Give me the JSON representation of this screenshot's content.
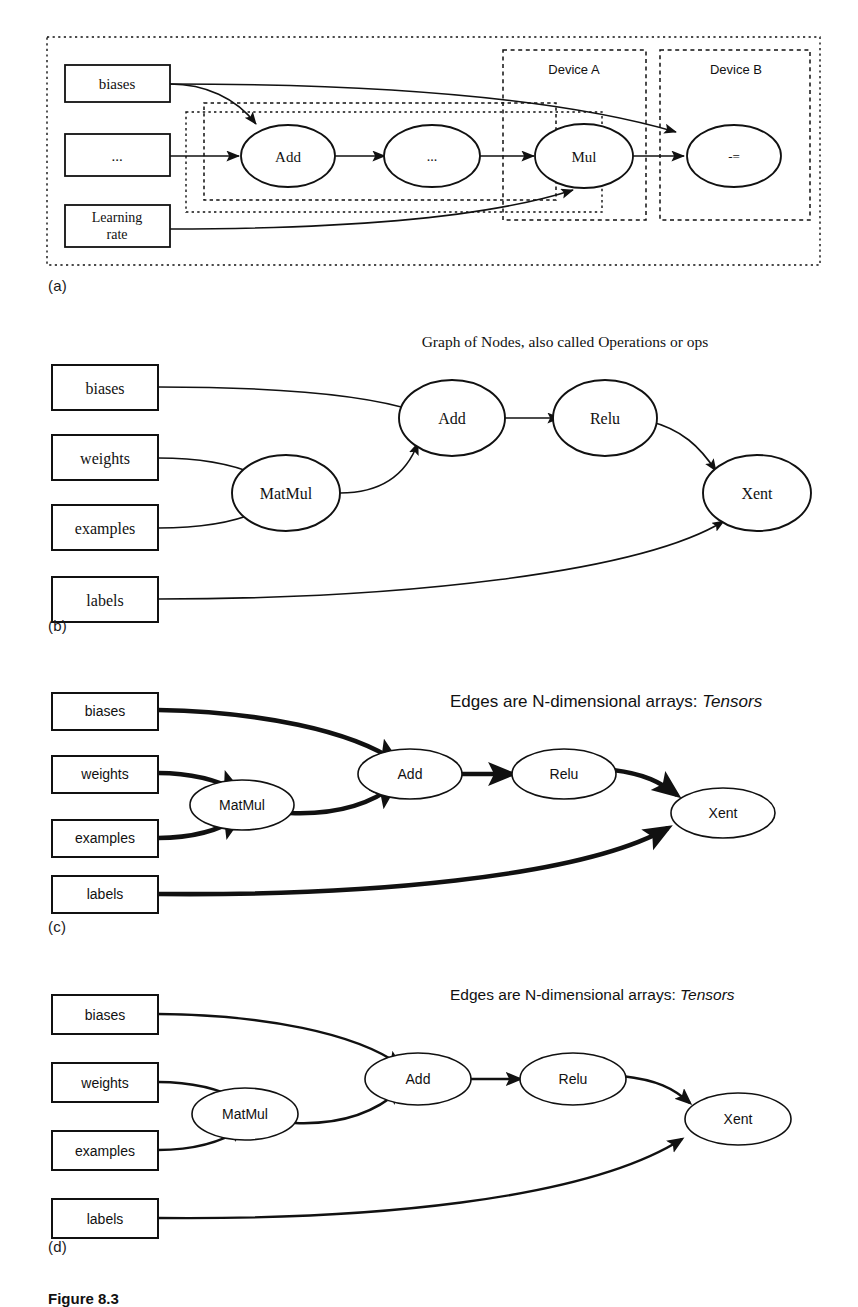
{
  "figure": {
    "caption": "Figure 8.3",
    "panel_labels": [
      "(a)",
      "(b)",
      "(c)",
      "(d)"
    ]
  },
  "panel_a": {
    "label": "(a)",
    "devices": [
      {
        "name": "Device A"
      },
      {
        "name": "Device B"
      }
    ],
    "inputs": [
      {
        "label": "biases"
      },
      {
        "label": "..."
      },
      {
        "label": "Learning\nrate",
        "line1": "Learning",
        "line2": "rate"
      }
    ],
    "ops": [
      {
        "label": "Add"
      },
      {
        "label": "..."
      },
      {
        "label": "Mul"
      },
      {
        "label": "-="
      }
    ],
    "edges": [
      {
        "from": "biases",
        "to": "Add"
      },
      {
        "from": "biases",
        "to": "-="
      },
      {
        "from": "...",
        "to": "Add"
      },
      {
        "from": "Add",
        "to": "..."
      },
      {
        "from": "...",
        "to": "Mul"
      },
      {
        "from": "Mul",
        "to": "-="
      },
      {
        "from": "Learning rate",
        "to": "Mul"
      }
    ]
  },
  "panel_b": {
    "label": "(b)",
    "caption": "Graph of Nodes, also called Operations or ops",
    "inputs": [
      {
        "label": "biases"
      },
      {
        "label": "weights"
      },
      {
        "label": "examples"
      },
      {
        "label": "labels"
      }
    ],
    "ops": [
      {
        "label": "MatMul"
      },
      {
        "label": "Add"
      },
      {
        "label": "Relu"
      },
      {
        "label": "Xent"
      }
    ],
    "edges": [
      {
        "from": "biases",
        "to": "Add"
      },
      {
        "from": "weights",
        "to": "MatMul"
      },
      {
        "from": "examples",
        "to": "MatMul"
      },
      {
        "from": "MatMul",
        "to": "Add"
      },
      {
        "from": "Add",
        "to": "Relu"
      },
      {
        "from": "Relu",
        "to": "Xent"
      },
      {
        "from": "labels",
        "to": "Xent"
      }
    ]
  },
  "panel_c": {
    "label": "(c)",
    "caption_plain": "Edges are N-dimensional arrays: ",
    "caption_italic": "Tensors",
    "inputs": [
      {
        "label": "biases"
      },
      {
        "label": "weights"
      },
      {
        "label": "examples"
      },
      {
        "label": "labels"
      }
    ],
    "ops": [
      {
        "label": "MatMul"
      },
      {
        "label": "Add"
      },
      {
        "label": "Relu"
      },
      {
        "label": "Xent"
      }
    ],
    "edges": [
      {
        "from": "biases",
        "to": "Add"
      },
      {
        "from": "weights",
        "to": "MatMul"
      },
      {
        "from": "examples",
        "to": "MatMul"
      },
      {
        "from": "MatMul",
        "to": "Add"
      },
      {
        "from": "Add",
        "to": "Relu"
      },
      {
        "from": "Relu",
        "to": "Xent"
      },
      {
        "from": "labels",
        "to": "Xent"
      }
    ],
    "edge_style": "thick"
  },
  "panel_d": {
    "label": "(d)",
    "caption_plain": "Edges are N-dimensional arrays: ",
    "caption_italic": "Tensors",
    "inputs": [
      {
        "label": "biases"
      },
      {
        "label": "weights"
      },
      {
        "label": "examples"
      },
      {
        "label": "labels"
      }
    ],
    "ops": [
      {
        "label": "MatMul"
      },
      {
        "label": "Add"
      },
      {
        "label": "Relu"
      },
      {
        "label": "Xent"
      }
    ],
    "edges": [
      {
        "from": "biases",
        "to": "Add"
      },
      {
        "from": "weights",
        "to": "MatMul"
      },
      {
        "from": "examples",
        "to": "MatMul"
      },
      {
        "from": "MatMul",
        "to": "Add"
      },
      {
        "from": "Add",
        "to": "Relu"
      },
      {
        "from": "Relu",
        "to": "Xent"
      },
      {
        "from": "labels",
        "to": "Xent"
      }
    ],
    "edge_style": "thin"
  },
  "colors": {
    "ink": "#111111",
    "background": "#ffffff"
  }
}
